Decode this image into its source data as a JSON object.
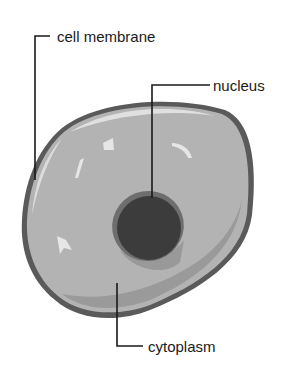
{
  "diagram": {
    "labels": {
      "membrane": "cell membrane",
      "nucleus": "nucleus",
      "cytoplasm": "cytoplasm"
    },
    "colors": {
      "membrane_outline": "#5a5a5a",
      "cytoplasm_fill": "#b3b3b3",
      "cytoplasm_shadow": "#9a9a9a",
      "highlight": "#e6e6e6",
      "nucleus_fill": "#3c3c3c",
      "nucleus_rim": "#6e6e6e",
      "leader_line": "#1a1a1a"
    }
  }
}
